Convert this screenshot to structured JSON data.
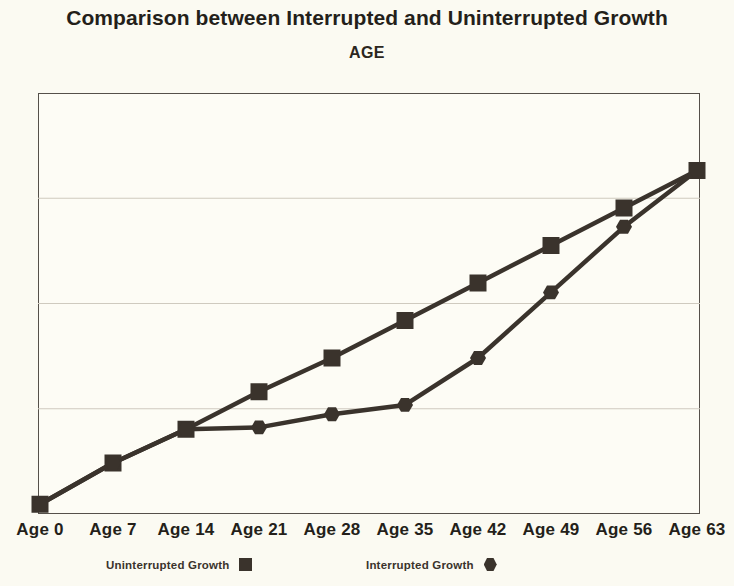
{
  "chart_data": {
    "type": "line",
    "title": "Comparison between Interrupted and Uninterrupted Growth",
    "subtitle": "AGE",
    "xlabel": "AGE",
    "ylabel": "Physical Symmetry",
    "categories": [
      "Age 0",
      "Age 7",
      "Age 14",
      "Age 21",
      "Age 28",
      "Age 35",
      "Age 42",
      "Age 49",
      "Age 56",
      "Age 63"
    ],
    "x": [
      0,
      7,
      14,
      21,
      28,
      35,
      42,
      49,
      56,
      63
    ],
    "ylim": [
      0,
      100
    ],
    "yticks": [],
    "grid": "horizontal",
    "legend_position": "bottom",
    "series": [
      {
        "name": "Uninterrupted Growth",
        "marker": "square",
        "color": "#3a332c",
        "values": [
          1,
          12,
          21,
          31,
          40,
          50,
          60,
          70,
          80,
          90
        ]
      },
      {
        "name": "Interrupted Growth",
        "marker": "hexagon",
        "color": "#3a332c",
        "values": [
          1,
          12,
          21,
          21.5,
          25,
          27.5,
          40,
          57.5,
          75,
          90
        ]
      }
    ]
  },
  "legend": {
    "uninterrupted_label": "Uninterrupted Growth",
    "interrupted_label": "Interrupted Growth"
  },
  "colors": {
    "ink": "#3a332c",
    "frame": "#55504a",
    "grid": "#cfcabf",
    "background": "#fbfaf2",
    "plot_background": "#fdfcf5"
  }
}
